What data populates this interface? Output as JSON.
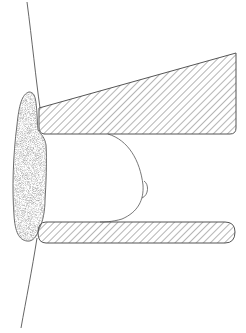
{
  "figure": {
    "colors": {
      "stroke": "#555555",
      "hatch": "#777777",
      "stipple": "#9a9a9a",
      "background": "#ffffff"
    },
    "labels": []
  }
}
